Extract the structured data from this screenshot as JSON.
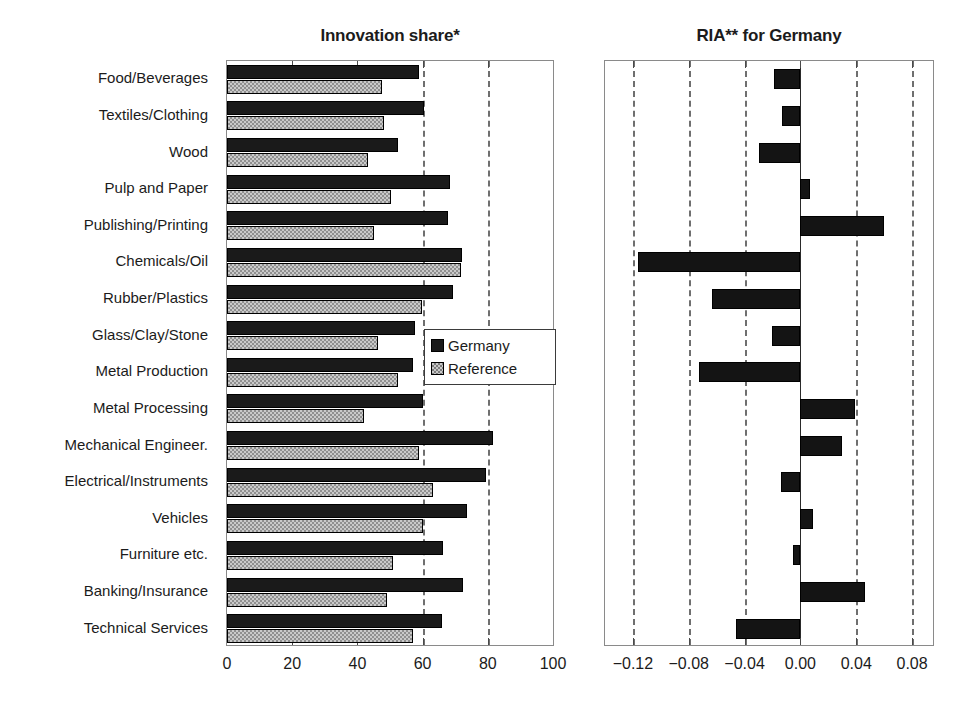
{
  "chart_data": [
    {
      "type": "bar",
      "orientation": "horizontal",
      "title": "Innovation share*",
      "xlabel": "",
      "ylabel": "",
      "xlim": [
        0,
        100
      ],
      "xticks": [
        0,
        20,
        40,
        60,
        80,
        100
      ],
      "xticklabels": [
        "0",
        "20",
        "40",
        "60",
        "80",
        "100"
      ],
      "gridlines_at": [
        60,
        80
      ],
      "grid": true,
      "legend": [
        "Germany",
        "Reference"
      ],
      "legend_position": "center-right-inside",
      "categories": [
        "Food/Beverages",
        "Textiles/Clothing",
        "Wood",
        "Pulp and Paper",
        "Publishing/Printing",
        "Chemicals/Oil",
        "Rubber/Plastics",
        "Glass/Clay/Stone",
        "Metal Production",
        "Metal Processing",
        "Mechanical Engineer.",
        "Electrical/Instruments",
        "Vehicles",
        "Furniture etc.",
        "Banking/Insurance",
        "Technical Services"
      ],
      "series": [
        {
          "name": "Germany",
          "color": "#1a1a1a",
          "values": [
            58.9,
            60.4,
            52.5,
            68.3,
            67.7,
            72.0,
            69.3,
            57.6,
            57.0,
            60.0,
            81.5,
            79.3,
            73.5,
            66.2,
            72.4,
            66.0
          ]
        },
        {
          "name": "Reference",
          "color": "#c9c9c9",
          "values": [
            47.6,
            48.2,
            43.2,
            50.3,
            45.2,
            71.7,
            59.8,
            46.4,
            52.4,
            41.9,
            58.9,
            63.1,
            60.0,
            51.0,
            49.1,
            57.0
          ]
        }
      ]
    },
    {
      "type": "bar",
      "orientation": "horizontal",
      "title": "RIA** for Germany",
      "xlabel": "",
      "ylabel": "",
      "xlim": [
        -0.14,
        0.095
      ],
      "xticks": [
        -0.12,
        -0.08,
        -0.04,
        0.0,
        0.04,
        0.08
      ],
      "xticklabels": [
        "−0.12",
        "−0.08",
        "−0.04",
        "0.00",
        "0.04",
        "0.08"
      ],
      "gridlines_at": [
        -0.12,
        -0.08,
        -0.04,
        0.04,
        0.08
      ],
      "zero_line_at": 0.0,
      "grid": true,
      "categories": [
        "Food/Beverages",
        "Textiles/Clothing",
        "Wood",
        "Pulp and Paper",
        "Publishing/Printing",
        "Chemicals/Oil",
        "Rubber/Plastics",
        "Glass/Clay/Stone",
        "Metal Production",
        "Metal Processing",
        "Mechanical Engineer.",
        "Electrical/Instruments",
        "Vehicles",
        "Furniture etc.",
        "Banking/Insurance",
        "Technical Services"
      ],
      "series": [
        {
          "name": "RIA for Germany",
          "color": "#141414",
          "values": [
            -0.019,
            -0.013,
            -0.03,
            0.007,
            0.06,
            -0.116,
            -0.063,
            -0.02,
            -0.073,
            0.039,
            0.03,
            -0.014,
            0.009,
            -0.005,
            0.046,
            -0.046
          ]
        }
      ]
    }
  ],
  "titles": {
    "left": "Innovation share*",
    "right": "RIA** for Germany"
  },
  "legend": {
    "germany_label": "Germany",
    "reference_label": "Reference"
  },
  "axis_left": {
    "labels": [
      "0",
      "20",
      "40",
      "60",
      "80",
      "100"
    ]
  },
  "axis_right": {
    "labels": [
      "−0.12",
      "−0.08",
      "−0.04",
      "0.00",
      "0.04",
      "0.08"
    ]
  },
  "colors": {
    "germany": "#1a1a1a",
    "reference": "#c9c9c9",
    "grid": "#6f6f6f",
    "frame": "#8a8a8a",
    "text": "#1b1b1b",
    "background": "#ffffff"
  }
}
